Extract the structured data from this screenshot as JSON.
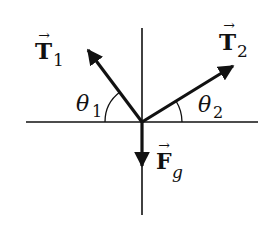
{
  "diagram": {
    "type": "free-body-diagram",
    "colors": {
      "line": "#111111",
      "background": "#ffffff"
    },
    "axes": {
      "horizontal": {
        "x1": 26,
        "y": 122,
        "x2": 258
      },
      "vertical": {
        "x": 142,
        "y1": 28,
        "y2": 215
      }
    },
    "vectors": [
      {
        "id": "T1",
        "symbol": "T",
        "subscript": "1",
        "vector_arrow": "→",
        "tip": [
          86,
          48
        ]
      },
      {
        "id": "T2",
        "symbol": "T",
        "subscript": "2",
        "vector_arrow": "→",
        "tip": [
          236,
          64
        ]
      },
      {
        "id": "Fg",
        "symbol": "F",
        "subscript": "g",
        "vector_arrow": "→",
        "tip": [
          142,
          168
        ]
      }
    ],
    "angles": [
      {
        "id": "theta1",
        "symbol": "θ",
        "subscript": "1",
        "between": [
          "T1",
          "negative-x-axis"
        ]
      },
      {
        "id": "theta2",
        "symbol": "θ",
        "subscript": "2",
        "between": [
          "T2",
          "positive-x-axis"
        ]
      }
    ]
  }
}
